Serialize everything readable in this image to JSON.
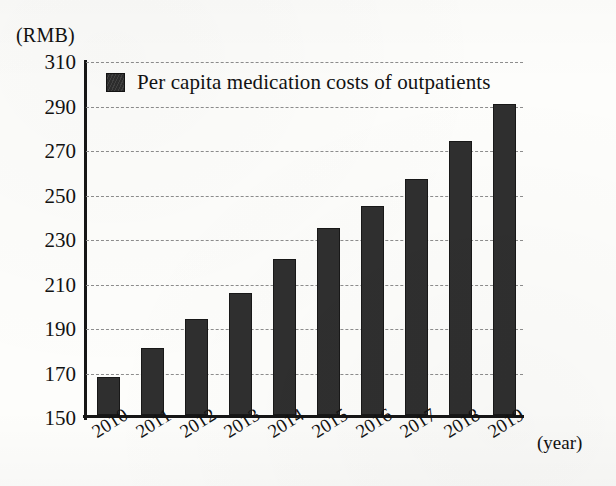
{
  "chart_data": {
    "type": "bar",
    "title": "",
    "xlabel": "(year)",
    "ylabel": "(RMB)",
    "categories": [
      "2010",
      "2011",
      "2012",
      "2013",
      "2014",
      "2015",
      "2016",
      "2017",
      "2018",
      "2019"
    ],
    "values": [
      167,
      180,
      193,
      205,
      220,
      234,
      244,
      256,
      273,
      290
    ],
    "series": [
      {
        "name": "Per capita medication costs of outpatients",
        "values": [
          167,
          180,
          193,
          205,
          220,
          234,
          244,
          256,
          273,
          290
        ]
      }
    ],
    "ylim": [
      150,
      310
    ],
    "ytick_labels": [
      "310",
      "290",
      "270",
      "250",
      "230",
      "210",
      "190",
      "170",
      "150"
    ],
    "ytick_values": [
      310,
      290,
      270,
      250,
      230,
      210,
      190,
      170,
      150
    ],
    "ytick_step": 20,
    "grid": true,
    "grid_style": "dashed-horizontal",
    "legend": {
      "position": "top-left-inside",
      "entries": [
        "Per capita medication costs of outpatients"
      ]
    },
    "bar_color": "#2f2f2f",
    "axis_color": "#161616",
    "gridline_color": "#8d8d8d",
    "background_color": "#fdfdfb"
  },
  "legend": {
    "label": "Per capita medication costs of outpatients",
    "swatch_name": "legend-swatch-dark"
  },
  "axes": {
    "unit_label": "(RMB)",
    "x_title": "(year)"
  }
}
